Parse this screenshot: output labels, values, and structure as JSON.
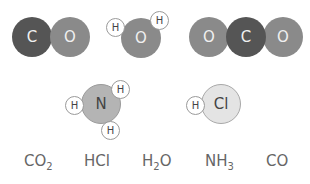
{
  "molecules": {
    "co": {
      "atoms": [
        "C",
        "O"
      ]
    },
    "h2o": {
      "atoms": [
        "O",
        "H",
        "H"
      ]
    },
    "co2": {
      "atoms": [
        "O",
        "C",
        "O"
      ]
    },
    "nh3": {
      "atoms": [
        "N",
        "H",
        "H",
        "H"
      ]
    },
    "hcl": {
      "atoms": [
        "Cl",
        "H"
      ]
    }
  },
  "labels": [
    {
      "main": "CO",
      "sub": "2",
      "tail": ""
    },
    {
      "main": "HCl",
      "sub": "",
      "tail": ""
    },
    {
      "main": "H",
      "sub": "2",
      "tail": "O"
    },
    {
      "main": "NH",
      "sub": "3",
      "tail": ""
    },
    {
      "main": "CO",
      "sub": "",
      "tail": ""
    }
  ],
  "colors": {
    "carbon": "#555555",
    "oxygen": "#8a8a8a",
    "nitrogen": "#b4b4b4",
    "chlorine": "#e4e4e4",
    "hydrogen": "#ffffff"
  }
}
